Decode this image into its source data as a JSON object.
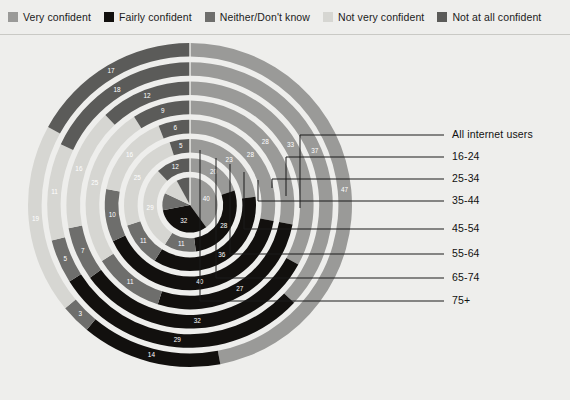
{
  "legend": {
    "items": [
      {
        "label": "Very confident",
        "color": "#9a9a98",
        "key": "very"
      },
      {
        "label": "Fairly confident",
        "color": "#12100e",
        "key": "fairly"
      },
      {
        "label": "Neither/Don't know",
        "color": "#6e6e6c",
        "key": "neither"
      },
      {
        "label": "Not very confident",
        "color": "#d6d6d2",
        "key": "notvery"
      },
      {
        "label": "Not at all confident",
        "color": "#5b5b59",
        "key": "notatall"
      }
    ]
  },
  "chart_data": {
    "type": "pie",
    "title": "",
    "subtitle": "",
    "xlabel": "",
    "ylabel": "",
    "legend_position": "top",
    "grid": false,
    "layout": "radial-stacked-rings",
    "note": "Concentric stacked rings, one ring per age group; innermost ring (75+) is drawn as a full pie. All series sum to 100.",
    "series": [
      {
        "name": "Very confident",
        "color": "#9a9a98"
      },
      {
        "name": "Fairly confident",
        "color": "#12100e"
      },
      {
        "name": "Neither/Don't know",
        "color": "#6e6e6c"
      },
      {
        "name": "Not very confident",
        "color": "#d6d6d2"
      },
      {
        "name": "Not at all confident",
        "color": "#5b5b59"
      }
    ],
    "categories": [
      "All internet users",
      "16-24",
      "25-34",
      "35-44",
      "45-54",
      "55-64",
      "65-74",
      "75+"
    ],
    "rings": [
      {
        "category": "All internet users",
        "ring_index": 0,
        "values": {
          "very": 47,
          "fairly": 14,
          "neither": 3,
          "notvery": 19,
          "notatall": 17
        },
        "order": [
          "very",
          "fairly",
          "neither",
          "notvery",
          "notatall"
        ]
      },
      {
        "category": "16-24",
        "ring_index": 1,
        "values": {
          "very": 37,
          "fairly": 29,
          "neither": 5,
          "notvery": 11,
          "notatall": 18
        },
        "order": [
          "very",
          "fairly",
          "neither",
          "notvery",
          "notatall"
        ]
      },
      {
        "category": "25-34",
        "ring_index": 2,
        "values": {
          "very": 33,
          "fairly": 32,
          "neither": 7,
          "notvery": 16,
          "notatall": 12
        },
        "order": [
          "very",
          "fairly",
          "neither",
          "notvery",
          "notatall"
        ]
      },
      {
        "category": "35-44",
        "ring_index": 3,
        "values": {
          "very": 28,
          "fairly": 27,
          "neither": 11,
          "notvery": 25,
          "notatall": 9
        },
        "order": [
          "very",
          "fairly",
          "neither",
          "notvery",
          "notatall"
        ]
      },
      {
        "category": "45-54",
        "ring_index": 4,
        "values": {
          "very": 28,
          "fairly": 40,
          "neither": 10,
          "notvery": 16,
          "notatall": 6
        },
        "order": [
          "very",
          "fairly",
          "neither",
          "notvery",
          "notatall"
        ]
      },
      {
        "category": "55-64",
        "ring_index": 5,
        "values": {
          "very": 23,
          "fairly": 36,
          "neither": 11,
          "notvery": 25,
          "notatall": 5
        },
        "order": [
          "very",
          "fairly",
          "neither",
          "notvery",
          "notatall"
        ]
      },
      {
        "category": "65-74",
        "ring_index": 6,
        "values": {
          "very": 20,
          "fairly": 28,
          "neither": 11,
          "notvery": 29,
          "notatall": 12
        },
        "order": [
          "very",
          "fairly",
          "neither",
          "notvery",
          "notatall"
        ]
      },
      {
        "category": "75+",
        "ring_index": 7,
        "values": {
          "very": 40,
          "fairly": 32,
          "neither": 10,
          "notvery": 10,
          "notatall": 8
        },
        "order": [
          "very",
          "fairly",
          "neither",
          "notvery",
          "notatall"
        ]
      }
    ],
    "value_labels_shown": [
      17,
      19,
      12,
      9,
      6,
      5,
      3,
      23,
      28,
      28,
      33,
      37,
      47,
      40,
      14,
      11,
      11,
      16,
      10,
      11,
      40,
      27,
      32,
      29,
      30,
      36,
      28,
      32,
      10,
      8,
      10
    ]
  },
  "callouts": {
    "items": [
      {
        "label": "All internet users",
        "y": 135
      },
      {
        "label": "16-24",
        "y": 157
      },
      {
        "label": "25-34",
        "y": 179
      },
      {
        "label": "35-44",
        "y": 201
      },
      {
        "label": "45-54",
        "y": 229
      },
      {
        "label": "55-64",
        "y": 254
      },
      {
        "label": "65-74",
        "y": 278
      },
      {
        "label": "75+",
        "y": 301
      }
    ]
  }
}
